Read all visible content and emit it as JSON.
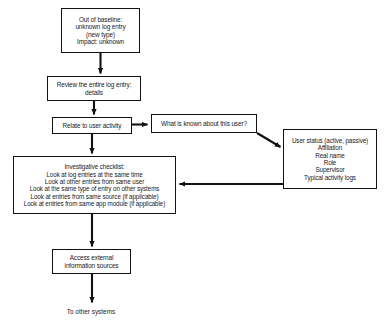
{
  "diagram": {
    "background_color": "#ffffff",
    "stroke_color": "#111111",
    "text_color": "#1a1a1a",
    "nodes": {
      "out_of_baseline": {
        "lines": [
          "Out of baseline:",
          "unknown log entry",
          "(new type)",
          "Impact: unknown"
        ]
      },
      "review_log_entry": {
        "lines": [
          "Review the entire log entry:",
          "details"
        ]
      },
      "relate_user_activity": {
        "lines": [
          "Relate to user activity"
        ]
      },
      "what_known_user": {
        "lines": [
          "What is known about this user?"
        ]
      },
      "user_attributes": {
        "lines": [
          "User status (active, passive)",
          "Affiliation",
          "Real name",
          "Role",
          "Supervisor",
          "Typical activity logs"
        ]
      },
      "investigative_checklist": {
        "lines": [
          "Investigative checklist:",
          "Look at log entries at the same time",
          "Look at other entries from same user",
          "Look at the same type of entry on other systems",
          "Look at entries from same source (if applicable)",
          "Look at entries from same app module (if applicable)"
        ]
      },
      "access_external": {
        "lines": [
          "Access external",
          "information sources"
        ]
      },
      "to_other_systems": {
        "label": "To other systems"
      }
    }
  }
}
